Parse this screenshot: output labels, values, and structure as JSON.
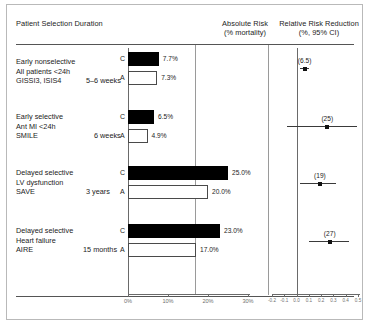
{
  "headers": {
    "left_line1": "Patient Selection",
    "left_line2": "Duration",
    "left_combined": "Patient Selection  Duration",
    "absolute_line1": "Absolute Risk",
    "absolute_line2": "(% mortality)",
    "relative_line1": "Relative Risk Reduction",
    "relative_line2": "(%, 95% CI)"
  },
  "arm_labels": {
    "control": "C",
    "active": "A"
  },
  "absolute_axis": {
    "ticks": [
      "0%",
      "10%",
      "20%",
      "30%"
    ],
    "values": [
      0,
      10,
      20,
      30
    ],
    "min": 0,
    "max": 30
  },
  "relative_axis": {
    "ticks": [
      "-0.2",
      "-0.1",
      "0.0",
      "0.1",
      "0.2",
      "0.3",
      "0.4",
      "0.5"
    ],
    "values": [
      -0.2,
      -0.1,
      0.0,
      0.1,
      0.2,
      0.3,
      0.4,
      0.5
    ],
    "min": -0.2,
    "max": 0.5
  },
  "rows": [
    {
      "selection_line1": "Early nonselective",
      "selection_line2": "All patients  <24h",
      "selection_line3": "GISSI3, ISIS4",
      "duration": "5–6 weeks",
      "control_label": "7.7%",
      "active_label": "7.3%",
      "control_value": 7.7,
      "active_value": 7.3,
      "rrr_label": "(6.5)",
      "rrr_value": 0.065,
      "ci_low": 0.03,
      "ci_high": 0.1
    },
    {
      "selection_line1": "Early selective",
      "selection_line2": "Ant MI <24h",
      "selection_line3": "SMILE",
      "duration": "6 weeks",
      "control_label": "6.5%",
      "active_label": "4.9%",
      "control_value": 6.5,
      "active_value": 4.9,
      "rrr_label": "(25)",
      "rrr_value": 0.25,
      "ci_low": -0.08,
      "ci_high": 0.49
    },
    {
      "selection_line1": "Delayed selective",
      "selection_line2": "LV dysfunction",
      "selection_line3": "SAVE",
      "duration": "3 years",
      "control_label": "25.0%",
      "active_label": "20.0%",
      "control_value": 25.0,
      "active_value": 20.0,
      "rrr_label": "(19)",
      "rrr_value": 0.19,
      "ci_low": 0.03,
      "ci_high": 0.32
    },
    {
      "selection_line1": "Delayed selective",
      "selection_line2": "Heart failure",
      "selection_line3": "AIRE",
      "duration": "15 months",
      "control_label": "23.0%",
      "active_label": "17.0%",
      "control_value": 23.0,
      "active_value": 17.0,
      "rrr_label": "(27)",
      "rrr_value": 0.27,
      "ci_low": 0.1,
      "ci_high": 0.43
    }
  ],
  "chart_data": {
    "type": "bar",
    "xlabel": "",
    "ylabel": "",
    "categories": [
      "GISSI3, ISIS4",
      "SMILE",
      "SAVE",
      "AIRE"
    ],
    "series": [
      {
        "name": "C (control)",
        "values": [
          7.7,
          6.5,
          25.0,
          23.0
        ]
      },
      {
        "name": "A (ACE inhibitor)",
        "values": [
          7.3,
          4.9,
          20.0,
          17.0
        ]
      }
    ],
    "xlim": [
      0,
      30
    ],
    "grid": false,
    "legend": "none",
    "secondary_plot": {
      "type": "scatter",
      "name": "Relative Risk Reduction (%, 95% CI)",
      "categories": [
        "GISSI3, ISIS4",
        "SMILE",
        "SAVE",
        "AIRE"
      ],
      "point_labels": [
        "(6.5)",
        "(25)",
        "(19)",
        "(27)"
      ],
      "values": [
        0.065,
        0.25,
        0.19,
        0.27
      ],
      "ci_low": [
        0.03,
        -0.08,
        0.03,
        0.1
      ],
      "ci_high": [
        0.1,
        0.49,
        0.32,
        0.43
      ],
      "xlim": [
        -0.2,
        0.5
      ],
      "reference_line": 0.0
    }
  }
}
